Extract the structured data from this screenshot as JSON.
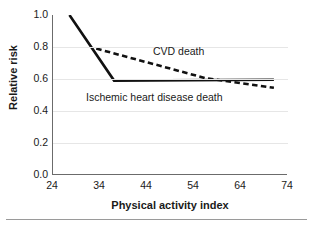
{
  "chart_data": {
    "type": "line",
    "title": "",
    "xlabel": "Physical activity index",
    "ylabel": "Relative risk",
    "xlim": [
      24,
      74
    ],
    "ylim": [
      0.0,
      1.0
    ],
    "xticks": [
      "24",
      "34",
      "44",
      "54",
      "64",
      "74"
    ],
    "yticks": [
      "0.0",
      "0.2",
      "0.4",
      "0.6",
      "0.8",
      "1.0"
    ],
    "grid": "horizontal",
    "legend_position": "inline-annotation",
    "series": [
      {
        "name": "Ischemic heart disease death",
        "style": "solid",
        "color": "#111111",
        "x": [
          27.5,
          37.0,
          71.0
        ],
        "y": [
          1.0,
          0.59,
          0.595
        ]
      },
      {
        "name": "CVD death",
        "style": "dashed",
        "color": "#111111",
        "x": [
          33.2,
          56.5,
          71.0
        ],
        "y": [
          0.79,
          0.605,
          0.545
        ]
      }
    ]
  },
  "axes": {
    "y_title": "Relative risk",
    "x_title": "Physical activity index",
    "y_tick_labels": [
      "1.0",
      "0.8",
      "0.6",
      "0.4",
      "0.2",
      "0.0"
    ],
    "x_tick_labels": [
      "24",
      "34",
      "44",
      "54",
      "64",
      "74"
    ]
  },
  "annotations": {
    "cvd": "CVD death",
    "ihd": "Ischemic heart disease death"
  },
  "colors": {
    "line": "#111111",
    "axis": "#6b6b6b",
    "grid": "#e6e6e6",
    "rule": "#9a9a9a",
    "text": "#1a1a1a",
    "background": "#ffffff"
  }
}
